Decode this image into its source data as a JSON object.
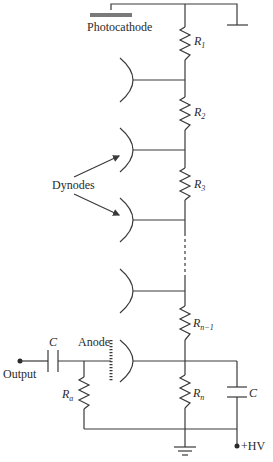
{
  "diagram": {
    "type": "circuit",
    "labels": {
      "photocathode": "Photocathode",
      "dynodes": "Dynodes",
      "anode": "Anode",
      "output": "Output",
      "hv": "+HV"
    },
    "resistors": [
      {
        "id": "R1",
        "base": "R",
        "sub": "1"
      },
      {
        "id": "R2",
        "base": "R",
        "sub": "2"
      },
      {
        "id": "R3",
        "base": "R",
        "sub": "3"
      },
      {
        "id": "Rn-1",
        "base": "R",
        "sub": "n−1"
      },
      {
        "id": "Rn",
        "base": "R",
        "sub": "n"
      },
      {
        "id": "Ra",
        "base": "R",
        "sub": "a"
      }
    ],
    "capacitors": [
      {
        "id": "C_out",
        "label": "C"
      },
      {
        "id": "C_hv",
        "label": "C"
      }
    ],
    "dynode_count_shown": 4,
    "colors": {
      "line": "#3a3a3a",
      "photocathode": "#7a7a7a",
      "background": "#ffffff"
    }
  }
}
